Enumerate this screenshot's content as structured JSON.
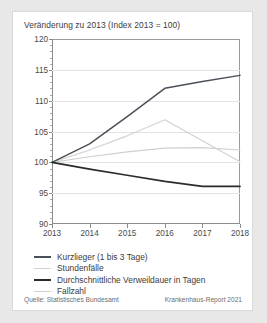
{
  "chart_data": {
    "type": "line",
    "title": "Veränderung zu 2013 (Index 2013 = 100)",
    "xlabel": "",
    "ylabel": "",
    "x": [
      2013,
      2014,
      2015,
      2016,
      2017,
      2018
    ],
    "xtick_labels": [
      "2013",
      "2014",
      "2015",
      "2016",
      "2017",
      "2018"
    ],
    "ytick_labels": [
      "120",
      "115",
      "110",
      "105",
      "100",
      "95",
      "90"
    ],
    "ytick_values": [
      120,
      115,
      110,
      105,
      100,
      95,
      90
    ],
    "ylim": [
      90,
      120
    ],
    "grid": true,
    "legend_position": "below",
    "series": [
      {
        "name": "Kurzlieger (1 bis 3 Tage)",
        "color": "#4a5059",
        "width": 1.5,
        "values": [
          100,
          103.0,
          107.4,
          112.0,
          113.1,
          114.1
        ]
      },
      {
        "name": "Stundenfälle",
        "color": "#d2d2d2",
        "width": 1.2,
        "values": [
          100,
          102.0,
          104.3,
          106.9,
          103.5,
          100.1
        ]
      },
      {
        "name": "Durchschnittliche Verweildauer in Tagen",
        "color": "#2b2b2b",
        "width": 1.7,
        "values": [
          100,
          98.9,
          97.9,
          96.9,
          96.1,
          96.1
        ]
      },
      {
        "name": "Fallzahl",
        "color": "#cfcfcf",
        "width": 1.2,
        "values": [
          100,
          100.9,
          101.7,
          102.3,
          102.4,
          102.0
        ]
      }
    ]
  },
  "footer": {
    "source": "Quelle: Statistisches Bundesamt",
    "report": "Krankenhaus-Report 2021"
  }
}
